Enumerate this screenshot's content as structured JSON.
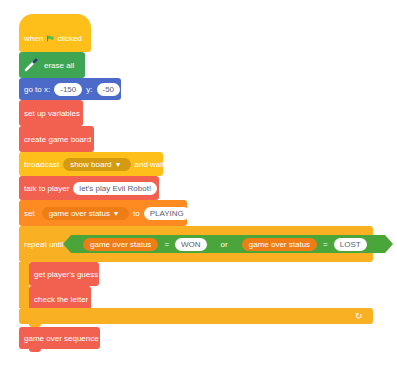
{
  "script": {
    "when_flag": {
      "prefix": "when",
      "icon": "green-flag-icon",
      "suffix": "clicked"
    },
    "erase_all": {
      "label": "erase all",
      "icon": "pen-icon"
    },
    "go_to": {
      "label_x": "go to x:",
      "x": "-150",
      "label_y": "y:",
      "y": "-50"
    },
    "set_up_variables": {
      "label": "set up variables"
    },
    "create_game_board": {
      "label": "create game board"
    },
    "broadcast": {
      "label": "broadcast",
      "message": "show board",
      "suffix": "and wait"
    },
    "talk_to_player": {
      "label": "talk to player",
      "value": "let's play Evil Robot!"
    },
    "set_var": {
      "label": "set",
      "variable": "game over status",
      "to": "to",
      "value": "PLAYING"
    },
    "repeat_until": {
      "label": "repeat until",
      "condition": {
        "left": {
          "variable": "game over status",
          "op": "=",
          "value": "WON"
        },
        "join": "or",
        "right": {
          "variable": "game over status",
          "op": "=",
          "value": "LOST"
        }
      },
      "body": [
        {
          "label": "get player's guess"
        },
        {
          "label": "check the letter"
        }
      ],
      "loop_icon": "↻"
    },
    "game_over_sequence": {
      "label": "game over sequence"
    }
  },
  "colors": {
    "events": "#ffbf1a",
    "pen": "#3ea652",
    "motion": "#4c6ac7",
    "my_blocks": "#f2604f",
    "control": "#f9b022",
    "variables": "#fd8b22",
    "operators": "#4aa63b"
  }
}
